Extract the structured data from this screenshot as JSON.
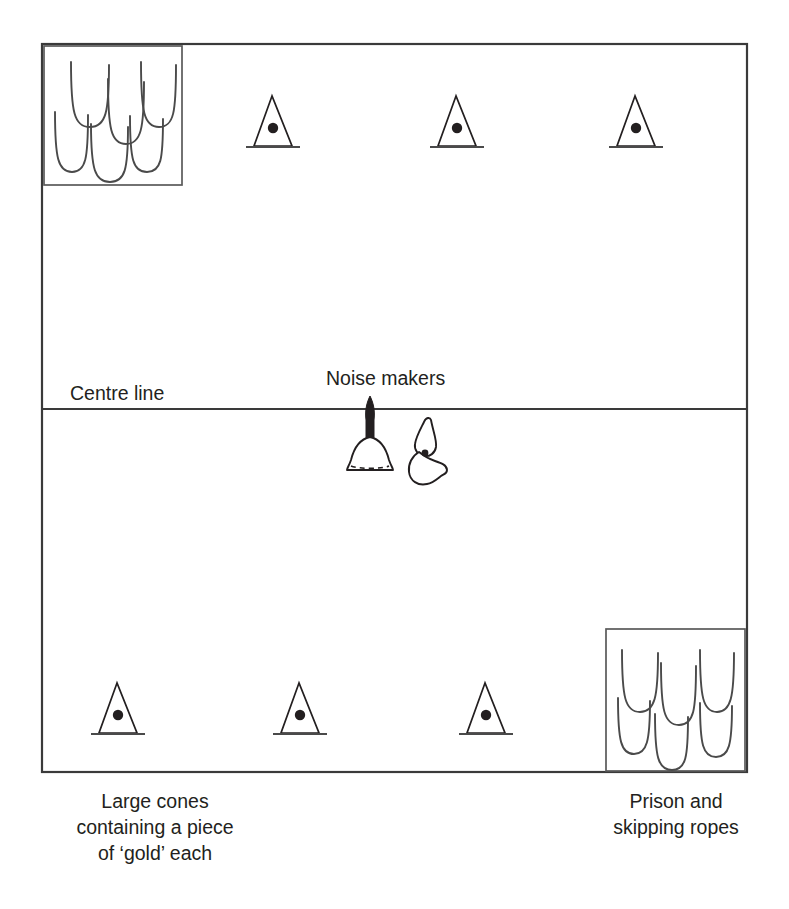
{
  "diagram": {
    "labels": {
      "centre_line": "Centre line",
      "noise_makers": "Noise makers"
    },
    "captions": {
      "left": {
        "line1": "Large cones",
        "line2": "containing a piece",
        "line3": "of ‘gold’ each"
      },
      "right": {
        "line1": "Prison and",
        "line2": "skipping ropes"
      }
    },
    "colors": {
      "stroke_frame": "#3a3a3a",
      "stroke_box": "#5a5a5a",
      "stroke_rope": "#4a4a4a",
      "ink": "#231f20",
      "background": "#ffffff"
    },
    "field": {
      "x": 42,
      "y": 44,
      "width": 705,
      "height": 728,
      "centre_line_y": 409
    },
    "icons": {
      "cone": "cone-icon",
      "cone_dot": "gold-piece-icon",
      "skipping_rope": "skipping-rope-icon",
      "bell": "hand-bell-icon",
      "whistle": "whistle-icon"
    },
    "cones": {
      "count_top": 3,
      "count_bottom": 3,
      "top_positions": [
        {
          "cx": 278,
          "base_y": 148
        },
        {
          "cx": 462,
          "base_y": 148
        },
        {
          "cx": 641,
          "base_y": 148
        }
      ],
      "bottom_positions": [
        {
          "cx": 118,
          "base_y": 735
        },
        {
          "cx": 300,
          "base_y": 735
        },
        {
          "cx": 486,
          "base_y": 735
        }
      ]
    },
    "boxes": {
      "cones_store": {
        "x": 44,
        "y": 46,
        "width": 138,
        "height": 139,
        "rope_count": 6
      },
      "prison": {
        "x": 606,
        "y": 629,
        "width": 139,
        "height": 142,
        "rope_count": 6
      }
    },
    "noise_makers_items": [
      "hand-bell",
      "whistle"
    ]
  }
}
